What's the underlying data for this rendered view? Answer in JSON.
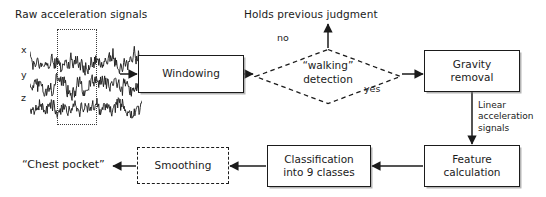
{
  "figure": {
    "type": "flowchart",
    "title_label": "Raw acceleration signals",
    "output_label": "“Chest pocket”",
    "terminal_label": "Holds previous judgment"
  },
  "signal": {
    "axis_labels": [
      "x",
      "y",
      "z"
    ],
    "window_selection_label": "window",
    "series": [
      {
        "name": "x",
        "baseline": 62,
        "amplitude": 13,
        "points": 190,
        "seed": 11
      },
      {
        "name": "y",
        "baseline": 86,
        "amplitude": 14,
        "points": 190,
        "seed": 27
      },
      {
        "name": "z",
        "baseline": 108,
        "amplitude": 13,
        "points": 190,
        "seed": 53
      }
    ]
  },
  "nodes": [
    {
      "id": "windowing",
      "label": "Windowing",
      "style": "solid",
      "x": 138,
      "y": 55,
      "w": 106,
      "h": 38
    },
    {
      "id": "walking",
      "label": "“walking”\ndetection",
      "style": "dashed-diamond",
      "x": 254,
      "y": 48,
      "w": 148,
      "h": 57
    },
    {
      "id": "gravity",
      "label": "Gravity\nremoval",
      "style": "solid",
      "x": 424,
      "y": 50,
      "w": 96,
      "h": 42
    },
    {
      "id": "feature",
      "label": "Feature\ncalculation",
      "style": "solid",
      "x": 424,
      "y": 145,
      "w": 96,
      "h": 42
    },
    {
      "id": "classification",
      "label": "Classification\ninto 9 classes",
      "style": "solid",
      "x": 267,
      "y": 145,
      "w": 104,
      "h": 42
    },
    {
      "id": "smoothing",
      "label": "Smoothing",
      "style": "dashed",
      "x": 137,
      "y": 147,
      "w": 92,
      "h": 37
    }
  ],
  "edge_labels": [
    {
      "id": "no",
      "text": "no",
      "x": 277,
      "y": 33
    },
    {
      "id": "yes",
      "text": "yes",
      "x": 364,
      "y": 84
    },
    {
      "id": "linear",
      "text": "Linear\nacceleration\nsignals",
      "x": 462,
      "y": 100
    }
  ],
  "colors": {
    "stroke": "#1b1b1b",
    "background": "#ffffff",
    "shadow": "#787878",
    "dotted_select": "#3a3a3a"
  }
}
